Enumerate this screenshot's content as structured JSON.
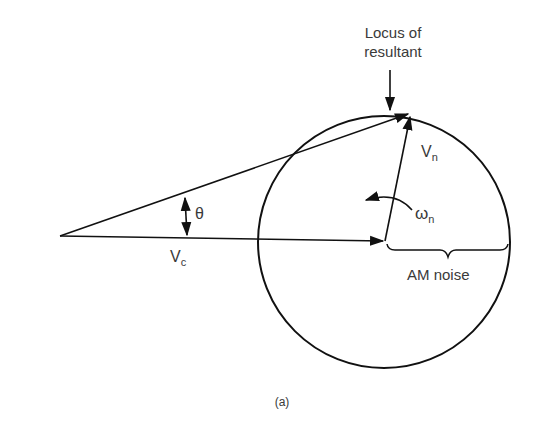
{
  "diagram": {
    "caption": "(a)",
    "labels": {
      "locus_line1": "Locus of",
      "locus_line2": "resultant",
      "vn_main": "V",
      "vn_sub": "n",
      "vc_main": "V",
      "vc_sub": "c",
      "theta": "θ",
      "omega_main": "ω",
      "omega_sub": "n",
      "am_noise": "AM noise"
    },
    "colors": {
      "stroke": "#111111",
      "text": "#3a3a3a",
      "background": "#ffffff"
    }
  }
}
